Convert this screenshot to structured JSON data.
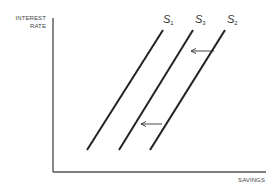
{
  "chart_data": {
    "type": "line",
    "title": "",
    "xlabel": "SAVINGS",
    "ylabel_lines": [
      "INTEREST",
      "RATE"
    ],
    "ylabel": "INTEREST RATE",
    "grid": false,
    "legend": "none",
    "series": [
      {
        "name": "S1",
        "base": "S",
        "sub": "1",
        "x": [
          87,
          163
        ],
        "y": [
          150,
          30
        ]
      },
      {
        "name": "S3",
        "base": "S",
        "sub": "3",
        "x": [
          119,
          193
        ],
        "y": [
          150,
          30
        ]
      },
      {
        "name": "S2",
        "base": "S",
        "sub": "2",
        "x": [
          150,
          225
        ],
        "y": [
          150,
          30
        ]
      }
    ],
    "annotations": [
      {
        "type": "arrow",
        "from": "S2",
        "to": "S3",
        "x1": 214,
        "x2": 191,
        "y": 51
      },
      {
        "type": "arrow",
        "from": "S2",
        "to": "S3",
        "x1": 162,
        "x2": 141,
        "y": 124
      }
    ],
    "colors": {
      "line": "#222222",
      "axis": "#555555",
      "text": "#444444"
    }
  }
}
